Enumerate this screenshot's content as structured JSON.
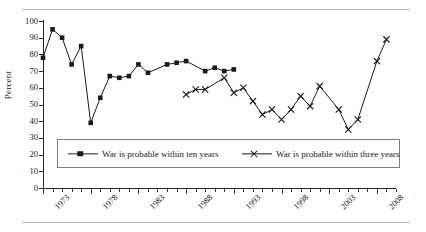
{
  "chart_data": {
    "type": "line",
    "title": "",
    "xlabel": "",
    "ylabel": "Percent",
    "ylim": [
      0,
      100
    ],
    "ytick_step": 10,
    "yticks": [
      0,
      10,
      20,
      30,
      40,
      50,
      60,
      70,
      80,
      90,
      100
    ],
    "xlim": [
      1973,
      2010
    ],
    "xticks": [
      1973,
      1978,
      1983,
      1988,
      1993,
      1998,
      2003,
      2008
    ],
    "xtick_labels": [
      "1973",
      "1978",
      "1983",
      "1988",
      "1993",
      "1998",
      "2003",
      "2008"
    ],
    "grid": false,
    "legend_position": "lower-center",
    "series": [
      {
        "name": "War is probable within ten years",
        "marker": "square",
        "color": "#1a1a1a",
        "points": [
          {
            "x": 1973,
            "y": 78
          },
          {
            "x": 1974,
            "y": 95
          },
          {
            "x": 1975,
            "y": 90
          },
          {
            "x": 1976,
            "y": 74
          },
          {
            "x": 1977,
            "y": 85
          },
          {
            "x": 1978,
            "y": 39
          },
          {
            "x": 1979,
            "y": 54
          },
          {
            "x": 1980,
            "y": 67
          },
          {
            "x": 1981,
            "y": 66
          },
          {
            "x": 1982,
            "y": 67
          },
          {
            "x": 1983,
            "y": 74
          },
          {
            "x": 1984,
            "y": 69
          },
          {
            "x": 1986,
            "y": 74
          },
          {
            "x": 1987,
            "y": 75
          },
          {
            "x": 1988,
            "y": 76
          },
          {
            "x": 1990,
            "y": 70
          },
          {
            "x": 1991,
            "y": 72
          },
          {
            "x": 1992,
            "y": 70
          },
          {
            "x": 1993,
            "y": 71
          }
        ]
      },
      {
        "name": "War is probable within three years",
        "marker": "x",
        "color": "#1a1a1a",
        "points": [
          {
            "x": 1988,
            "y": 56
          },
          {
            "x": 1989,
            "y": 59
          },
          {
            "x": 1990,
            "y": 59
          },
          {
            "x": 1992,
            "y": 66
          },
          {
            "x": 1993,
            "y": 57
          },
          {
            "x": 1994,
            "y": 60
          },
          {
            "x": 1995,
            "y": 52
          },
          {
            "x": 1996,
            "y": 44
          },
          {
            "x": 1997,
            "y": 47
          },
          {
            "x": 1998,
            "y": 41
          },
          {
            "x": 1999,
            "y": 47
          },
          {
            "x": 2000,
            "y": 55
          },
          {
            "x": 2001,
            "y": 49
          },
          {
            "x": 2002,
            "y": 61
          },
          {
            "x": 2004,
            "y": 47
          },
          {
            "x": 2005,
            "y": 35
          },
          {
            "x": 2006,
            "y": 41
          },
          {
            "x": 2008,
            "y": 76
          },
          {
            "x": 2009,
            "y": 89
          }
        ]
      }
    ]
  }
}
